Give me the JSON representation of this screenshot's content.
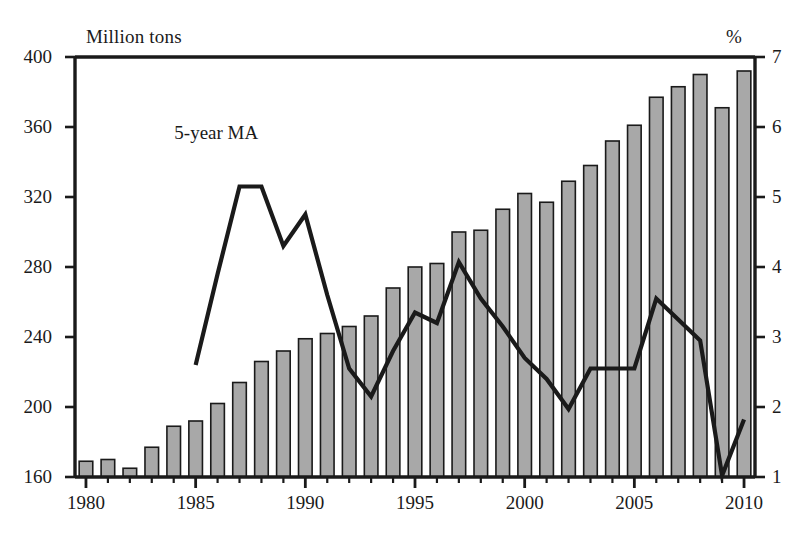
{
  "chart_data": {
    "type": "bar",
    "title": "",
    "subtitle": "",
    "xlabel": "",
    "ylabel": "Million tons",
    "y2label": "%",
    "grid": false,
    "legend_position": "inline-annotation",
    "categories": [
      1980,
      1981,
      1982,
      1983,
      1984,
      1985,
      1986,
      1987,
      1988,
      1989,
      1990,
      1991,
      1992,
      1993,
      1994,
      1995,
      1996,
      1997,
      1998,
      1999,
      2000,
      2001,
      2002,
      2003,
      2004,
      2005,
      2006,
      2007,
      2008,
      2009,
      2010
    ],
    "xlim": [
      1979.5,
      2010.5
    ],
    "x_tick_labels": [
      "1980",
      "1985",
      "1990",
      "1995",
      "2000",
      "2005",
      "2010"
    ],
    "x_tick_values": [
      1980,
      1985,
      1990,
      1995,
      2000,
      2005,
      2010
    ],
    "x_minor_ticks_every": 1,
    "ylim": [
      160,
      400
    ],
    "y_tick_labels": [
      "160",
      "200",
      "240",
      "280",
      "320",
      "360",
      "400"
    ],
    "y_tick_values": [
      160,
      200,
      240,
      280,
      320,
      360,
      400
    ],
    "y2lim": [
      1,
      7
    ],
    "y2_tick_labels": [
      "1",
      "2",
      "3",
      "4",
      "5",
      "6",
      "7"
    ],
    "y2_tick_values": [
      1,
      2,
      3,
      4,
      5,
      6,
      7
    ],
    "series": [
      {
        "name": "Production",
        "type": "bar",
        "axis": "left",
        "unit": "Million tons",
        "color": "#a8a8a8",
        "edge_color": "#1a1a1a",
        "values": [
          169,
          170,
          165,
          177,
          189,
          192,
          202,
          214,
          226,
          232,
          239,
          242,
          246,
          252,
          268,
          280,
          282,
          300,
          301,
          313,
          322,
          317,
          329,
          338,
          352,
          361,
          377,
          383,
          390,
          371,
          392
        ]
      },
      {
        "name": "5-year MA",
        "type": "line",
        "axis": "right",
        "unit": "%",
        "color": "#1a1a1a",
        "annotation": "5-year MA",
        "x": [
          1985,
          1986,
          1987,
          1988,
          1989,
          1990,
          1991,
          1992,
          1993,
          1994,
          1995,
          1996,
          1997,
          1998,
          1999,
          2000,
          2001,
          2002,
          2003,
          2004,
          2005,
          2006,
          2007,
          2008,
          2009,
          2010
        ],
        "values": [
          2.6,
          3.9,
          5.15,
          5.15,
          4.3,
          4.75,
          3.6,
          2.55,
          2.15,
          2.8,
          3.35,
          3.2,
          4.07,
          3.55,
          3.15,
          2.7,
          2.4,
          1.97,
          2.55,
          2.55,
          2.55,
          3.55,
          3.25,
          2.95,
          1.02,
          1.82
        ]
      }
    ],
    "annotations": [
      {
        "text": "5-year MA",
        "x": 1986.4,
        "y_axis": "right",
        "y": 5.9
      }
    ]
  },
  "labels": {
    "left_axis_title": "Million tons",
    "right_axis_title": "%",
    "series_annotation": "5-year MA"
  },
  "colors": {
    "bar_fill": "#a8a8a8",
    "bar_edge": "#1a1a1a",
    "line": "#1a1a1a",
    "axis": "#1a1a1a",
    "background": "#ffffff"
  }
}
